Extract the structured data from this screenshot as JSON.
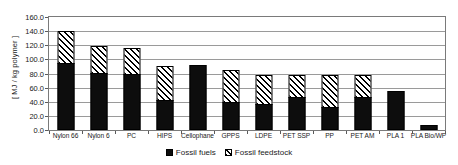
{
  "chart_data": {
    "type": "bar",
    "stacked": true,
    "title": "",
    "xlabel": "",
    "ylabel": "[ MJ / kg polymer ]",
    "ylim": [
      0,
      160
    ],
    "ytick_step": 20,
    "yticks": [
      "0.0",
      "20.0",
      "40.0",
      "60.0",
      "80.0",
      "100.0",
      "120.0",
      "140.0",
      "160.0"
    ],
    "grid": true,
    "legend_position": "bottom-center",
    "categories": [
      "Nylon 66",
      "Nylon 6",
      "PC",
      "HIPS",
      "Cellophane",
      "GPPS",
      "LDPE",
      "PET SSP",
      "PP",
      "PET AM",
      "PLA 1",
      "PLA Bio/WP"
    ],
    "series": [
      {
        "name": "Fossil fuels",
        "style": "solid-black",
        "color": "#0d0d0d",
        "values": [
          95.0,
          81.0,
          79.0,
          43.0,
          92.0,
          40.0,
          37.0,
          47.0,
          33.0,
          47.0,
          55.0,
          7.0
        ]
      },
      {
        "name": "Fossil feedstock",
        "style": "diagonal-hatch",
        "color": "#ffffff",
        "values": [
          47.0,
          39.0,
          38.0,
          49.0,
          0.0,
          46.0,
          43.0,
          33.0,
          46.0,
          32.0,
          0.0,
          0.0
        ]
      }
    ],
    "totals": [
      142.0,
      120.0,
      117.0,
      92.0,
      92.0,
      86.0,
      80.0,
      80.0,
      79.0,
      79.0,
      55.0,
      7.0
    ]
  },
  "legend": {
    "items": [
      {
        "label": "Fossil fuels"
      },
      {
        "label": "Fossil feedstock"
      }
    ]
  }
}
